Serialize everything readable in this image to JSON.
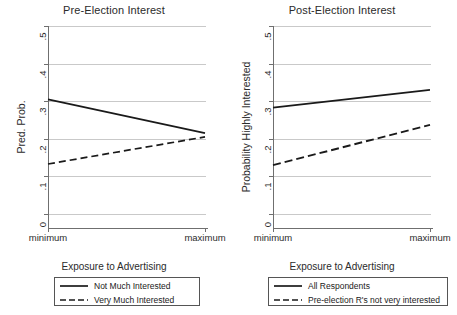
{
  "figure": {
    "width": 457,
    "height": 315,
    "background": "#ffffff",
    "line_color": "#1a1a1a",
    "grid_color": "#c9c9c9",
    "axis_color": "#6f6f6f"
  },
  "chart_data": [
    {
      "type": "line",
      "title": "Pre-Election Interest",
      "xlabel": "Exposure to Advertising",
      "ylabel": "Pred. Prob.",
      "x": [
        "minimum",
        "maximum"
      ],
      "xtick_labels": [
        "minimum",
        "maximum"
      ],
      "ylim": [
        0,
        0.5
      ],
      "yticks": [
        0,
        0.1,
        0.2,
        0.3,
        0.4,
        0.5
      ],
      "ytick_labels": [
        "0",
        ".1",
        ".2",
        ".3",
        ".4",
        ".5"
      ],
      "grid": true,
      "legend_position": "below",
      "series": [
        {
          "name": "Not Much Interested",
          "style": "solid",
          "values": [
            0.305,
            0.215
          ]
        },
        {
          "name": "Very Much Interested",
          "style": "dashed",
          "values": [
            0.133,
            0.205
          ]
        }
      ]
    },
    {
      "type": "line",
      "title": "Post-Election Interest",
      "xlabel": "Exposure to Advertising",
      "ylabel": "Probability Highly Interested",
      "x": [
        "minimum",
        "maximum"
      ],
      "xtick_labels": [
        "minimum",
        "maximum"
      ],
      "ylim": [
        0,
        0.5
      ],
      "yticks": [
        0,
        0.1,
        0.2,
        0.3,
        0.4,
        0.5
      ],
      "ytick_labels": [
        "0",
        ".1",
        ".2",
        ".3",
        ".4",
        ".5"
      ],
      "grid": true,
      "legend_position": "below",
      "series": [
        {
          "name": "All Respondents",
          "style": "solid",
          "values": [
            0.283,
            0.33
          ]
        },
        {
          "name": "Pre-election R's not very interested",
          "style": "dashed",
          "values": [
            0.13,
            0.237
          ]
        }
      ]
    }
  ],
  "panels": {
    "left": {
      "title": "Pre-Election Interest",
      "y_axis_title": "Pred. Prob.",
      "x_axis_title": "Exposure to Advertising",
      "ytick_labels": [
        "0",
        ".1",
        ".2",
        ".3",
        ".4",
        ".5"
      ],
      "xtick_labels": [
        "minimum",
        "maximum"
      ],
      "legend": [
        {
          "label": "Not Much Interested",
          "style": "solid"
        },
        {
          "label": "Very Much Interested",
          "style": "dashed"
        }
      ]
    },
    "right": {
      "title": "Post-Election Interest",
      "y_axis_title": "Probability Highly Interested",
      "x_axis_title": "Exposure to Advertising",
      "ytick_labels": [
        "0",
        ".1",
        ".2",
        ".3",
        ".4",
        ".5"
      ],
      "xtick_labels": [
        "minimum",
        "maximum"
      ],
      "legend": [
        {
          "label": "All Respondents",
          "style": "solid"
        },
        {
          "label": "Pre-election R's not very interested",
          "style": "dashed"
        }
      ]
    }
  }
}
